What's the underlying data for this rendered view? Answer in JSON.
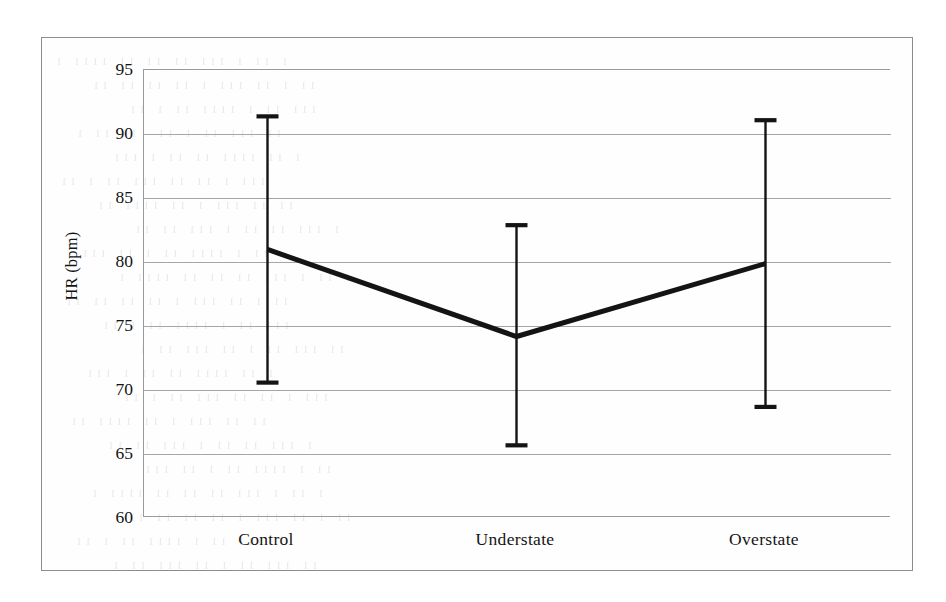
{
  "figure": {
    "frame_color": "#8c8c8c",
    "background": "#ffffff",
    "series_color": "#141414",
    "grid_color": "#a6a6a6"
  },
  "axis": {
    "y_title": "HR (bpm)",
    "y_ticks": [
      "95",
      "90",
      "85",
      "80",
      "75",
      "70",
      "65",
      "60"
    ],
    "x_ticks": [
      "Control",
      "Understate",
      "Overstate"
    ]
  },
  "bleed_through": {
    "lines": [
      "ı ıı ı ııı ıı ıı ıı ıııı ı",
      "ıı ı ıı ııı ı ıı ıı ıı ıı",
      "ııı ıı ı ıııı ıı ı ıı",
      "ıı ııı ıı ı ıı ııı ıı ı",
      "ı ıı ıııı ıı ıı ı ııı",
      "ııı ı ıı ıı ııı ıı ı ıı",
      "ıı ıı ııı ı ıı ıııı ıı",
      "ı ııı ıı ıı ı ııı ıı ıı",
      "ıı ı ıııı ıı ı ıı ııı"
    ]
  },
  "chart_data": {
    "type": "line",
    "title": "",
    "xlabel": "",
    "ylabel": "HR (bpm)",
    "categories": [
      "Control",
      "Understate",
      "Overstate"
    ],
    "values": [
      80.9,
      74.1,
      79.8
    ],
    "error_bars": {
      "upper": [
        91.3,
        82.8,
        91.0
      ],
      "lower": [
        70.5,
        65.6,
        68.6
      ]
    },
    "series": [
      {
        "name": "HR",
        "values": [
          80.9,
          74.1,
          79.8
        ],
        "err_upper": [
          91.3,
          82.8,
          91.0
        ],
        "err_lower": [
          70.5,
          65.6,
          68.6
        ]
      }
    ],
    "ylim": [
      60,
      95
    ],
    "ytick_values": [
      95,
      90,
      85,
      80,
      75,
      70,
      65,
      60
    ],
    "grid": "horizontal",
    "legend": "none",
    "marker": "none",
    "line_width_px": 5
  }
}
